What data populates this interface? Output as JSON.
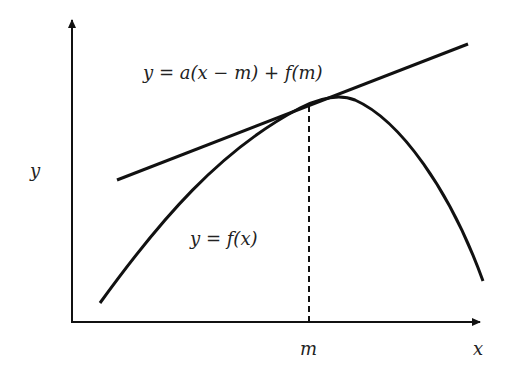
{
  "diagram": {
    "axes": {
      "x_label": "x",
      "y_label": "y",
      "x_tick_label": "m"
    },
    "labels": {
      "tangent_equation": "y = a(x − m) + f(m)",
      "curve_equation": "y = f(x)"
    },
    "colors": {
      "stroke": "#111111",
      "background": "#ffffff"
    },
    "elements": [
      {
        "type": "curve",
        "name": "f(x)",
        "shape": "concave parabola-like"
      },
      {
        "type": "line",
        "name": "tangent",
        "touches_curve_at": "x = m"
      },
      {
        "type": "dashed-line",
        "name": "vertical at m"
      }
    ]
  }
}
